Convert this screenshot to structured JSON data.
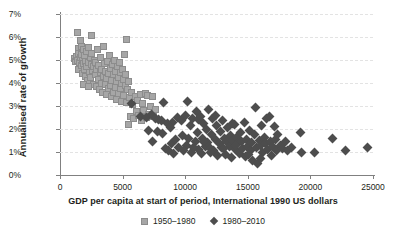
{
  "chart_data": {
    "type": "scatter",
    "title": "",
    "xlabel": "GDP per capita at start of period, International 1990 US dollars",
    "ylabel": "Annualised rate of growth",
    "xlim": [
      0,
      25000
    ],
    "ylim": [
      0,
      7
    ],
    "xticks": [
      "0",
      "5000",
      "10000",
      "15000",
      "20000",
      "25000"
    ],
    "xtick_values": [
      0,
      5000,
      10000,
      15000,
      20000,
      25000
    ],
    "yticks": [
      "0%",
      "1%",
      "2%",
      "3%",
      "4%",
      "5%",
      "6%",
      "7%"
    ],
    "ytick_values": [
      0,
      1,
      2,
      3,
      4,
      5,
      6,
      7
    ],
    "grid": "horizontal-dashed",
    "legend_position": "bottom-center",
    "colors": {
      "series1_fill": "#a6a6a6",
      "series1_edge": "#8c8c8c",
      "series2_fill": "#4d4d4d",
      "axis": "#808080",
      "grid": "#e3e3e3",
      "text": "#231f20",
      "background": "#ffffff"
    },
    "series": [
      {
        "name": "1950–1980",
        "marker": "square",
        "points": [
          [
            1150,
            5.05
          ],
          [
            1250,
            4.95
          ],
          [
            1300,
            5.15
          ],
          [
            1400,
            6.2
          ],
          [
            1420,
            5.0
          ],
          [
            1450,
            4.6
          ],
          [
            1480,
            5.5
          ],
          [
            1500,
            5.3
          ],
          [
            1550,
            4.9
          ],
          [
            1600,
            5.85
          ],
          [
            1620,
            5.1
          ],
          [
            1680,
            4.75
          ],
          [
            1700,
            5.6
          ],
          [
            1750,
            5.25
          ],
          [
            1800,
            4.4
          ],
          [
            1820,
            5.0
          ],
          [
            1850,
            4.85
          ],
          [
            1900,
            5.45
          ],
          [
            1950,
            4.6
          ],
          [
            1980,
            5.2
          ],
          [
            2000,
            4.95
          ],
          [
            2050,
            4.3
          ],
          [
            2100,
            5.35
          ],
          [
            2150,
            4.7
          ],
          [
            2200,
            4.1
          ],
          [
            2250,
            5.55
          ],
          [
            2300,
            4.9
          ],
          [
            2350,
            4.45
          ],
          [
            2400,
            5.1
          ],
          [
            2450,
            4.25
          ],
          [
            2500,
            4.8
          ],
          [
            2550,
            5.3
          ],
          [
            2600,
            4.55
          ],
          [
            2650,
            3.95
          ],
          [
            2700,
            4.7
          ],
          [
            2750,
            5.0
          ],
          [
            2800,
            4.35
          ],
          [
            2850,
            4.9
          ],
          [
            2900,
            3.85
          ],
          [
            2950,
            4.6
          ],
          [
            3000,
            5.45
          ],
          [
            3050,
            4.15
          ],
          [
            3100,
            4.75
          ],
          [
            3150,
            3.7
          ],
          [
            3200,
            4.45
          ],
          [
            3250,
            5.1
          ],
          [
            3300,
            4.0
          ],
          [
            3350,
            4.6
          ],
          [
            3400,
            3.6
          ],
          [
            3450,
            4.3
          ],
          [
            3500,
            5.6
          ],
          [
            3550,
            4.85
          ],
          [
            3600,
            3.95
          ],
          [
            3650,
            4.5
          ],
          [
            3700,
            3.5
          ],
          [
            3750,
            4.2
          ],
          [
            3800,
            4.95
          ],
          [
            3850,
            3.75
          ],
          [
            3900,
            4.4
          ],
          [
            3950,
            5.2
          ],
          [
            4000,
            3.9
          ],
          [
            4050,
            4.65
          ],
          [
            4100,
            3.4
          ],
          [
            4150,
            4.1
          ],
          [
            4200,
            4.8
          ],
          [
            4250,
            3.6
          ],
          [
            4300,
            4.35
          ],
          [
            4350,
            5.0
          ],
          [
            4400,
            3.8
          ],
          [
            4450,
            4.5
          ],
          [
            4500,
            3.3
          ],
          [
            4550,
            4.05
          ],
          [
            4600,
            4.7
          ],
          [
            4650,
            3.55
          ],
          [
            4700,
            4.25
          ],
          [
            4750,
            4.9
          ],
          [
            4800,
            3.75
          ],
          [
            4850,
            4.45
          ],
          [
            4900,
            3.2
          ],
          [
            4950,
            4.0
          ],
          [
            5000,
            4.6
          ],
          [
            5050,
            3.45
          ],
          [
            5100,
            4.15
          ],
          [
            5150,
            5.25
          ],
          [
            5200,
            3.9
          ],
          [
            5250,
            4.35
          ],
          [
            5300,
            5.9
          ],
          [
            5350,
            3.15
          ],
          [
            5400,
            3.7
          ],
          [
            5450,
            4.05
          ],
          [
            5500,
            2.2
          ],
          [
            5550,
            3.35
          ],
          [
            5600,
            2.55
          ],
          [
            5700,
            3.6
          ],
          [
            5800,
            3.05
          ],
          [
            5900,
            2.45
          ],
          [
            6000,
            3.4
          ],
          [
            6100,
            2.75
          ],
          [
            6200,
            3.25
          ],
          [
            6300,
            2.6
          ],
          [
            6400,
            3.5
          ],
          [
            6500,
            2.35
          ],
          [
            6600,
            3.1
          ],
          [
            6700,
            2.8
          ],
          [
            6800,
            3.55
          ],
          [
            6900,
            2.5
          ],
          [
            7000,
            3.45
          ],
          [
            7100,
            2.65
          ],
          [
            7200,
            3.0
          ],
          [
            7350,
            3.4
          ],
          [
            7500,
            2.55
          ],
          [
            7600,
            2.85
          ],
          [
            2480,
            6.05
          ],
          [
            1900,
            3.95
          ],
          [
            2250,
            3.85
          ]
        ]
      },
      {
        "name": "1980–2010",
        "marker": "diamond",
        "points": [
          [
            5700,
            3.1
          ],
          [
            6400,
            2.55
          ],
          [
            6900,
            2.5
          ],
          [
            7100,
            1.95
          ],
          [
            7300,
            2.65
          ],
          [
            7400,
            1.45
          ],
          [
            7600,
            2.45
          ],
          [
            7900,
            2.4
          ],
          [
            8100,
            2.35
          ],
          [
            8300,
            3.15
          ],
          [
            8400,
            1.15
          ],
          [
            8600,
            2.25
          ],
          [
            8700,
            1.05
          ],
          [
            8900,
            1.35
          ],
          [
            9000,
            2.3
          ],
          [
            9200,
            1.55
          ],
          [
            9400,
            2.5
          ],
          [
            9500,
            1.2
          ],
          [
            9700,
            2.35
          ],
          [
            9800,
            1.7
          ],
          [
            10000,
            2.6
          ],
          [
            10100,
            1.3
          ],
          [
            10200,
            3.2
          ],
          [
            10400,
            2.15
          ],
          [
            10500,
            1.0
          ],
          [
            10600,
            2.45
          ],
          [
            10800,
            1.45
          ],
          [
            10900,
            2.75
          ],
          [
            11000,
            1.85
          ],
          [
            11100,
            1.1
          ],
          [
            11200,
            2.55
          ],
          [
            11300,
            0.95
          ],
          [
            11400,
            1.6
          ],
          [
            11500,
            2.25
          ],
          [
            11600,
            1.25
          ],
          [
            11700,
            2.0
          ],
          [
            11800,
            1.4
          ],
          [
            11900,
            2.85
          ],
          [
            12000,
            1.15
          ],
          [
            12100,
            1.75
          ],
          [
            12200,
            2.45
          ],
          [
            12300,
            1.05
          ],
          [
            12400,
            1.55
          ],
          [
            12500,
            2.15
          ],
          [
            12600,
            0.85
          ],
          [
            12700,
            1.35
          ],
          [
            12800,
            1.9
          ],
          [
            12900,
            1.2
          ],
          [
            13000,
            2.35
          ],
          [
            13100,
            1.6
          ],
          [
            13200,
            0.9
          ],
          [
            13300,
            1.45
          ],
          [
            13400,
            2.05
          ],
          [
            13500,
            1.25
          ],
          [
            13600,
            1.7
          ],
          [
            13700,
            0.75
          ],
          [
            13800,
            1.5
          ],
          [
            13900,
            2.2
          ],
          [
            14000,
            1.1
          ],
          [
            14100,
            1.65
          ],
          [
            14200,
            1.35
          ],
          [
            14300,
            0.95
          ],
          [
            14400,
            1.85
          ],
          [
            14500,
            1.45
          ],
          [
            14600,
            1.15
          ],
          [
            14700,
            2.3
          ],
          [
            14800,
            0.8
          ],
          [
            14900,
            1.55
          ],
          [
            15000,
            1.25
          ],
          [
            15100,
            1.95
          ],
          [
            15200,
            1.05
          ],
          [
            15300,
            1.4
          ],
          [
            15400,
            0.65
          ],
          [
            15500,
            1.75
          ],
          [
            15600,
            2.95
          ],
          [
            15700,
            1.2
          ],
          [
            15800,
            0.5
          ],
          [
            15900,
            1.5
          ],
          [
            16000,
            1.3
          ],
          [
            16100,
            2.15
          ],
          [
            16200,
            1.0
          ],
          [
            16300,
            1.65
          ],
          [
            16400,
            1.35
          ],
          [
            16500,
            2.45
          ],
          [
            16600,
            1.1
          ],
          [
            16700,
            2.55
          ],
          [
            16800,
            1.45
          ],
          [
            16900,
            0.85
          ],
          [
            17000,
            1.25
          ],
          [
            17100,
            2.1
          ],
          [
            17200,
            1.55
          ],
          [
            17300,
            1.05
          ],
          [
            17400,
            1.75
          ],
          [
            17600,
            1.3
          ],
          [
            17800,
            1.15
          ],
          [
            18000,
            1.45
          ],
          [
            18200,
            1.05
          ],
          [
            18500,
            1.2
          ],
          [
            19200,
            1.85
          ],
          [
            19300,
            1.0
          ],
          [
            20300,
            1.0
          ],
          [
            21800,
            1.6
          ],
          [
            22800,
            1.05
          ],
          [
            24600,
            1.2
          ],
          [
            9100,
            0.95
          ],
          [
            9900,
            1.05
          ],
          [
            10700,
            1.2
          ],
          [
            12050,
            1.0
          ],
          [
            13050,
            1.15
          ],
          [
            14050,
            1.3
          ],
          [
            15050,
            0.9
          ],
          [
            16050,
            0.7
          ],
          [
            8800,
            2.05
          ],
          [
            11050,
            2.4
          ],
          [
            12450,
            2.6
          ],
          [
            13750,
            2.25
          ],
          [
            7800,
            1.9
          ],
          [
            8200,
            1.8
          ],
          [
            10300,
            1.6
          ],
          [
            11450,
            1.45
          ]
        ]
      }
    ]
  },
  "legend": {
    "items": [
      {
        "label": "1950–1980",
        "marker": "square"
      },
      {
        "label": "1980–2010",
        "marker": "diamond"
      }
    ]
  }
}
